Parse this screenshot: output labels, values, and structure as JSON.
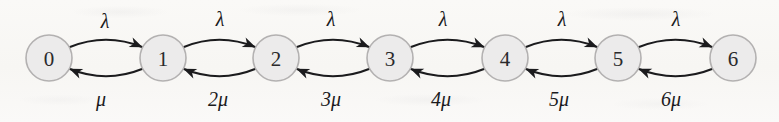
{
  "diagram": {
    "type": "birth-death-markov-chain-state-transition-diagram",
    "background_color": "#f9f8f6",
    "node_fill_color": "#ecebeb",
    "node_stroke_color": "#b3b1b1",
    "edge_color": "#1b1b1d",
    "node_radius": 23,
    "node_center_y": 58,
    "nodes": [
      {
        "id": "state-0",
        "label": "0",
        "cx": 49
      },
      {
        "id": "state-1",
        "label": "1",
        "cx": 163
      },
      {
        "id": "state-2",
        "label": "2",
        "cx": 276
      },
      {
        "id": "state-3",
        "label": "3",
        "cx": 390
      },
      {
        "id": "state-4",
        "label": "4",
        "cx": 505
      },
      {
        "id": "state-5",
        "label": "5",
        "cx": 618
      },
      {
        "id": "state-6",
        "label": "6",
        "cx": 733
      }
    ],
    "forward_edges": [
      {
        "from": "0",
        "to": "1",
        "label": "λ",
        "label_x": 105,
        "label_y": 21
      },
      {
        "from": "1",
        "to": "2",
        "label": "λ",
        "label_x": 220,
        "label_y": 19
      },
      {
        "from": "2",
        "to": "3",
        "label": "λ",
        "label_x": 331,
        "label_y": 19
      },
      {
        "from": "3",
        "to": "4",
        "label": "λ",
        "label_x": 443,
        "label_y": 19
      },
      {
        "from": "4",
        "to": "5",
        "label": "λ",
        "label_x": 562,
        "label_y": 19
      },
      {
        "from": "5",
        "to": "6",
        "label": "λ",
        "label_x": 676,
        "label_y": 19
      }
    ],
    "backward_edges": [
      {
        "from": "1",
        "to": "0",
        "label": "μ",
        "label_x": 101,
        "label_y": 99
      },
      {
        "from": "2",
        "to": "1",
        "label": "2μ",
        "label_x": 218,
        "label_y": 99
      },
      {
        "from": "3",
        "to": "2",
        "label": "3μ",
        "label_x": 331,
        "label_y": 99
      },
      {
        "from": "4",
        "to": "3",
        "label": "4μ",
        "label_x": 441,
        "label_y": 99
      },
      {
        "from": "5",
        "to": "4",
        "label": "5μ",
        "label_x": 559,
        "label_y": 99
      },
      {
        "from": "6",
        "to": "5",
        "label": "6μ",
        "label_x": 671,
        "label_y": 99
      }
    ]
  }
}
